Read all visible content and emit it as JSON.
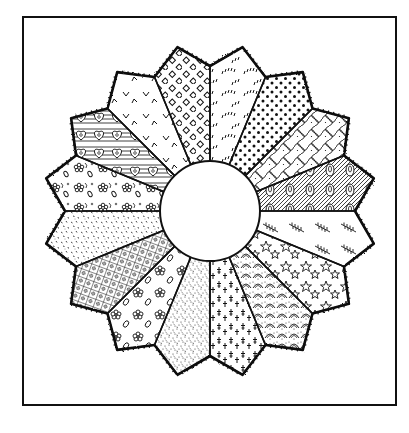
{
  "illustration": {
    "title": "Dresden Plate quilt block",
    "subject": "Line-art drawing of a Dresden Plate quilt block with 16 patterned blades around a plain center circle, inside a square frame",
    "colors": {
      "ink": "#111111",
      "paper": "#ffffff"
    },
    "frame": {
      "x": 23,
      "y": 17,
      "width": 373,
      "height": 388,
      "stroke_width": 2
    },
    "center": {
      "cx": 210,
      "cy": 211,
      "r": 50
    },
    "blade_geometry": {
      "count": 16,
      "valley_radius": 145,
      "tip_radius": 167,
      "start_angle_deg": -90,
      "sweep_deg": 22.5
    },
    "blades": [
      {
        "index": 1,
        "pattern": "arcs-of-ticks"
      },
      {
        "index": 2,
        "pattern": "polka-dots"
      },
      {
        "index": 3,
        "pattern": "lattice-net"
      },
      {
        "index": 4,
        "pattern": "hatched-paisley"
      },
      {
        "index": 5,
        "pattern": "fern-sprigs"
      },
      {
        "index": 6,
        "pattern": "stars"
      },
      {
        "index": 7,
        "pattern": "stippled-scallops"
      },
      {
        "index": 8,
        "pattern": "crosses"
      },
      {
        "index": 9,
        "pattern": "fine-stipple"
      },
      {
        "index": 10,
        "pattern": "flowers-and-leaves"
      },
      {
        "index": 11,
        "pattern": "windowpane-check"
      },
      {
        "index": 12,
        "pattern": "dash-speckle"
      },
      {
        "index": 13,
        "pattern": "floral-calico"
      },
      {
        "index": 14,
        "pattern": "hatched-hearts"
      },
      {
        "index": 15,
        "pattern": "v-marks"
      },
      {
        "index": 16,
        "pattern": "diamonds"
      }
    ]
  }
}
